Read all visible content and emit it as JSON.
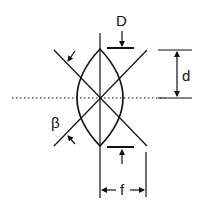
{
  "figure": {
    "labels": {
      "D": "D",
      "d": "d",
      "beta": "β",
      "f": "f"
    },
    "colors": {
      "stroke": "#111111",
      "background": "#ffffff"
    }
  }
}
